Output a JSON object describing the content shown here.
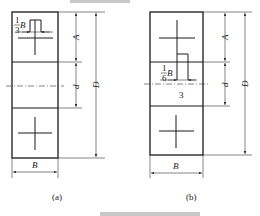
{
  "figure": {
    "panels": [
      {
        "id": "a",
        "caption": "(a)",
        "labels": {
          "width": "B",
          "top_height": "A",
          "middle_height": "d",
          "total_height": "D",
          "fraction_num": "1",
          "fraction_den": "3",
          "fraction_var": "B"
        }
      },
      {
        "id": "b",
        "caption": "(b)",
        "labels": {
          "width": "B",
          "top_height": "A",
          "middle_height": "d",
          "total_height": "D",
          "fraction_num": "1",
          "fraction_den": "6",
          "fraction_var": "B",
          "region_number": "3"
        }
      }
    ]
  }
}
